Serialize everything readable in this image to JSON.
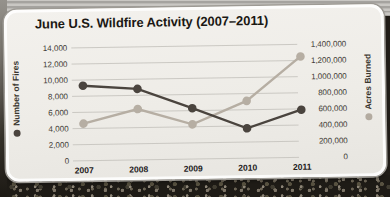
{
  "chart_data": {
    "type": "line",
    "title": "June U.S. Wildfire Activity (2007–2011)",
    "categories": [
      "2007",
      "2008",
      "2009",
      "2010",
      "2011"
    ],
    "series": [
      {
        "name": "Number of Fires",
        "axis": "left",
        "color": "#4a443e",
        "values": [
          9300,
          8800,
          6300,
          3700,
          5900
        ]
      },
      {
        "name": "Acres Burned",
        "axis": "right",
        "color": "#b6aea3",
        "values": [
          460000,
          630000,
          430000,
          710000,
          1250000
        ]
      }
    ],
    "left_axis": {
      "label": "Number of Fires",
      "min": 0,
      "max": 14000,
      "step": 2000,
      "ticks": [
        "14,000",
        "12,000",
        "10,000",
        "8,000",
        "6,000",
        "4,000",
        "2,000",
        "0"
      ]
    },
    "right_axis": {
      "label": "Acres Burned",
      "min": 0,
      "max": 1400000,
      "step": 200000,
      "ticks": [
        "1,400,000",
        "1,200,000",
        "1,000,000",
        "800,000",
        "600,000",
        "400,000",
        "200,000",
        "0"
      ]
    },
    "grid": true,
    "legend_position": "rotated-axis-titles"
  },
  "colors": {
    "fires_series": "#4a443e",
    "acres_series": "#b6aea3",
    "gridline": "#c7c4bf",
    "card_background": "#f0eee9",
    "title_text": "#1b1814",
    "tick_text": "#3f3b35"
  }
}
